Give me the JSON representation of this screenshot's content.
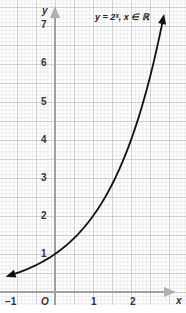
{
  "chart_data": {
    "type": "line",
    "xlabel": "x",
    "ylabel": "y",
    "x_ticks": [
      "-1",
      "O",
      "1",
      "2"
    ],
    "y_ticks": [
      "1",
      "2",
      "3",
      "4",
      "5",
      "6",
      "7"
    ],
    "xlim": [
      -1.4,
      3.4
    ],
    "ylim": [
      -0.6,
      7.5
    ],
    "grid": true,
    "series": [
      {
        "name": "y = 2^x",
        "x": [
          -1.2,
          -1,
          -0.5,
          0,
          0.5,
          1,
          1.5,
          2,
          2.5,
          2.85
        ],
        "values": [
          0.44,
          0.5,
          0.71,
          1,
          1.41,
          2,
          2.83,
          4,
          5.66,
          7.2
        ]
      }
    ]
  },
  "labels": {
    "title": "y = 2ˣ, x ∈ ℝ",
    "x_axis": "x",
    "y_axis": "y",
    "origin": "O",
    "x_neg1": "−1",
    "x1": "1",
    "x2": "2",
    "y1": "1",
    "y2": "2",
    "y3": "3",
    "y4": "4",
    "y5": "5",
    "y6": "6",
    "y7": "7"
  },
  "colors": {
    "grid": "#b5b5b5",
    "axis": "#a8a8a8",
    "curve": "#111111"
  }
}
